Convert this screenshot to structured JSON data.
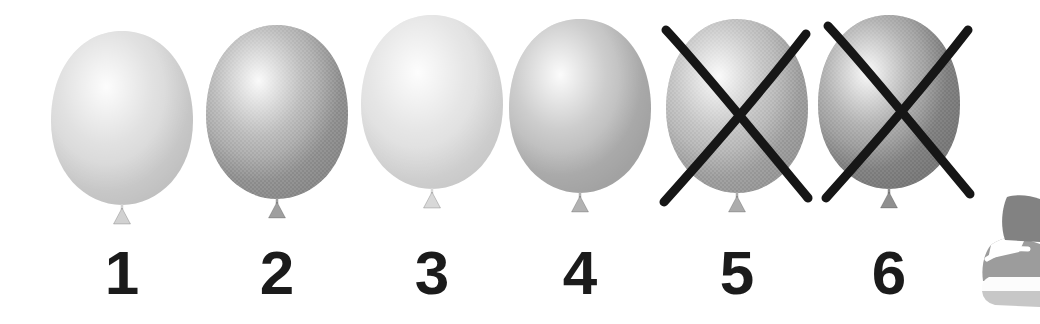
{
  "exercise": {
    "balloons": [
      {
        "label": "1",
        "crossed_out": false,
        "body_color": "#d1d1d1",
        "highlight_color": "#ffffff",
        "textured": false
      },
      {
        "label": "2",
        "crossed_out": false,
        "body_color": "#9f9f9f",
        "highlight_color": "#ffffff",
        "textured": true
      },
      {
        "label": "3",
        "crossed_out": false,
        "body_color": "#d8d8d8",
        "highlight_color": "#ffffff",
        "textured": false
      },
      {
        "label": "4",
        "crossed_out": false,
        "body_color": "#b2b2b2",
        "highlight_color": "#ffffff",
        "textured": false
      },
      {
        "label": "5",
        "crossed_out": true,
        "body_color": "#acacac",
        "highlight_color": "#ffffff",
        "textured": true
      },
      {
        "label": "6",
        "crossed_out": true,
        "body_color": "#8f8f8f",
        "highlight_color": "#ffffff",
        "textured": true
      }
    ],
    "cross_color": "#161616",
    "number_color": "#1b1b1b",
    "background_color": "#ffffff"
  },
  "decoration": {
    "shoe": {
      "ankle_color": "#828282",
      "upper_color": "#9c9c9c",
      "tongue_color": "#ffffff",
      "lace_color": "#ffffff",
      "midsole_color": "#fcfcfc",
      "outsole_color": "#c7c7c7"
    }
  }
}
